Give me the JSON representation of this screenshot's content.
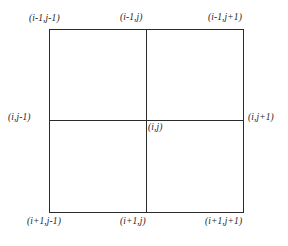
{
  "figure": {
    "title": "",
    "type": "stencil-diagram",
    "colors": {
      "background": "#ffffff",
      "line": "#2b2b2b",
      "text": "#1d1d1d"
    },
    "geometry": {
      "square_left": 49,
      "square_top": 29,
      "square_right": 243,
      "square_bottom": 212,
      "center_x": 146,
      "center_y": 120
    },
    "nodes": [
      {
        "key": "top-left",
        "label": "(i-1,j-1)"
      },
      {
        "key": "top-center",
        "label": "(i-1,j)"
      },
      {
        "key": "top-right",
        "label": "(i-1,j+1)"
      },
      {
        "key": "middle-left",
        "label": "(i,j-1)"
      },
      {
        "key": "center",
        "label": "(i,j)"
      },
      {
        "key": "middle-right",
        "label": "(i,j+1)"
      },
      {
        "key": "bottom-left",
        "label": "(i+1,j-1)"
      },
      {
        "key": "bottom-center",
        "label": "(i+1,j)"
      },
      {
        "key": "bottom-right",
        "label": "(i+1,j+1)"
      }
    ]
  }
}
